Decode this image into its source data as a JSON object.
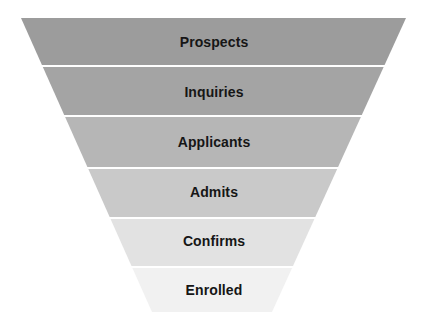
{
  "diagram": {
    "type": "funnel",
    "title": "",
    "orientation": "inverted-trapezoid",
    "background_color": "#ffffff",
    "label_color": "#161616",
    "gap_color": "#ffffff",
    "geometry": {
      "top_y": 18,
      "bottom_y": 312,
      "top_left_x": 21,
      "top_right_x": 406,
      "bottom_left_x": 152,
      "bottom_right_x": 272,
      "band_boundaries": [
        18,
        65,
        115,
        167,
        217,
        266,
        312
      ],
      "gap_height": 2
    },
    "stages": [
      {
        "label": "Prospects",
        "color": "#9c9c9c",
        "top": 18,
        "bottom": 65,
        "label_y": 44,
        "font_size": 14
      },
      {
        "label": "Inquiries",
        "color": "#a4a4a4",
        "top": 67,
        "bottom": 115,
        "label_y": 94,
        "font_size": 14
      },
      {
        "label": "Applicants",
        "color": "#b6b6b6",
        "top": 117,
        "bottom": 167,
        "label_y": 144,
        "font_size": 14
      },
      {
        "label": "Admits",
        "color": "#c9c9c9",
        "top": 169,
        "bottom": 217,
        "label_y": 194,
        "font_size": 14
      },
      {
        "label": "Confirms",
        "color": "#e2e2e2",
        "top": 219,
        "bottom": 266,
        "label_y": 243,
        "font_size": 14
      },
      {
        "label": "Enrolled",
        "color": "#f1f1f1",
        "top": 268,
        "bottom": 312,
        "label_y": 292,
        "font_size": 14
      }
    ]
  }
}
